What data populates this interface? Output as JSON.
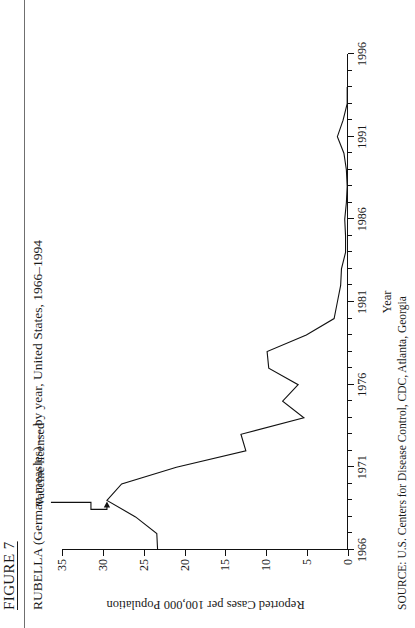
{
  "figure": {
    "heading": "FIGURE 7",
    "title": "RUBELLA (German measles)  — by year, United States, 1966–1994",
    "source": "SOURCE:  U.S. Centers for Disease Control, CDC, Atlanta, Georgia"
  },
  "annotation": {
    "label": "Vaccine licensed",
    "year": 1969
  },
  "chart_data": {
    "type": "line",
    "title": "RUBELLA (German measles)  — by year, United States, 1966–1994",
    "xlabel": "Year",
    "ylabel": "Reported Cases per  100,000 Population",
    "xlim": [
      1966,
      1996
    ],
    "ylim": [
      0,
      35
    ],
    "xticks": [
      1966,
      1971,
      1976,
      1981,
      1986,
      1991,
      1996
    ],
    "xticklabels": [
      "1966",
      "1971",
      "1976",
      "1981",
      "1986",
      "1991",
      "1996"
    ],
    "xminorticks": [
      1967,
      1968,
      1969,
      1970,
      1972,
      1973,
      1974,
      1975,
      1977,
      1978,
      1979,
      1980,
      1982,
      1983,
      1984,
      1985,
      1987,
      1988,
      1989,
      1990,
      1992,
      1993,
      1994,
      1995
    ],
    "yticks": [
      0,
      5,
      10,
      15,
      20,
      25,
      30,
      35
    ],
    "yticklabels": [
      "0",
      "5",
      "10",
      "15",
      "20",
      "25",
      "30",
      "35"
    ],
    "grid": false,
    "legend": null,
    "x": [
      1966,
      1967,
      1968,
      1969,
      1970,
      1971,
      1972,
      1973,
      1974,
      1975,
      1976,
      1977,
      1978,
      1979,
      1980,
      1981,
      1982,
      1983,
      1984,
      1985,
      1986,
      1987,
      1988,
      1989,
      1990,
      1991,
      1992,
      1993,
      1994
    ],
    "values": [
      23.3,
      23.4,
      26.0,
      29.5,
      27.7,
      21.0,
      12.5,
      13.1,
      5.4,
      8.0,
      6.1,
      9.7,
      9.9,
      5.1,
      1.7,
      1.3,
      0.9,
      0.8,
      0.3,
      0.3,
      0.4,
      0.2,
      0.1,
      0.2,
      0.5,
      1.3,
      0.6,
      0.1,
      0.1
    ],
    "series": [
      {
        "name": "Rubella reported cases per 100,000 population",
        "values": [
          23.3,
          23.4,
          26.0,
          29.5,
          27.7,
          21.0,
          12.5,
          13.1,
          5.4,
          8.0,
          6.1,
          9.7,
          9.9,
          5.1,
          1.7,
          1.3,
          0.9,
          0.8,
          0.3,
          0.3,
          0.4,
          0.2,
          0.1,
          0.2,
          0.5,
          1.3,
          0.6,
          0.1,
          0.1
        ]
      }
    ],
    "annotations": [
      {
        "text": "Vaccine licensed",
        "x": 1969,
        "y": 29.5
      }
    ]
  }
}
